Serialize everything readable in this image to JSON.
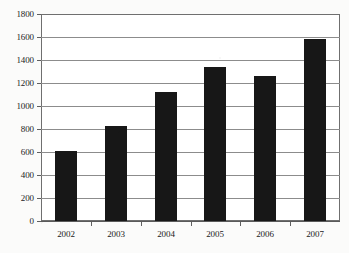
{
  "chart_data": {
    "type": "bar",
    "title": "",
    "xlabel": "",
    "ylabel": "",
    "categories": [
      "2002",
      "2003",
      "2004",
      "2005",
      "2006",
      "2007"
    ],
    "values": [
      610,
      830,
      1120,
      1340,
      1265,
      1580
    ],
    "ylim": [
      0,
      1800
    ],
    "ytick_step": 200,
    "yticks": [
      "0",
      "200",
      "400",
      "600",
      "800",
      "1000",
      "1200",
      "1400",
      "1600",
      "1800"
    ],
    "grid": true,
    "legend": "none",
    "bar_color": "#171717",
    "gridline_color": "#8c8c8c",
    "frame_color": "#6f6f6f",
    "background_color": "#ffffff"
  }
}
